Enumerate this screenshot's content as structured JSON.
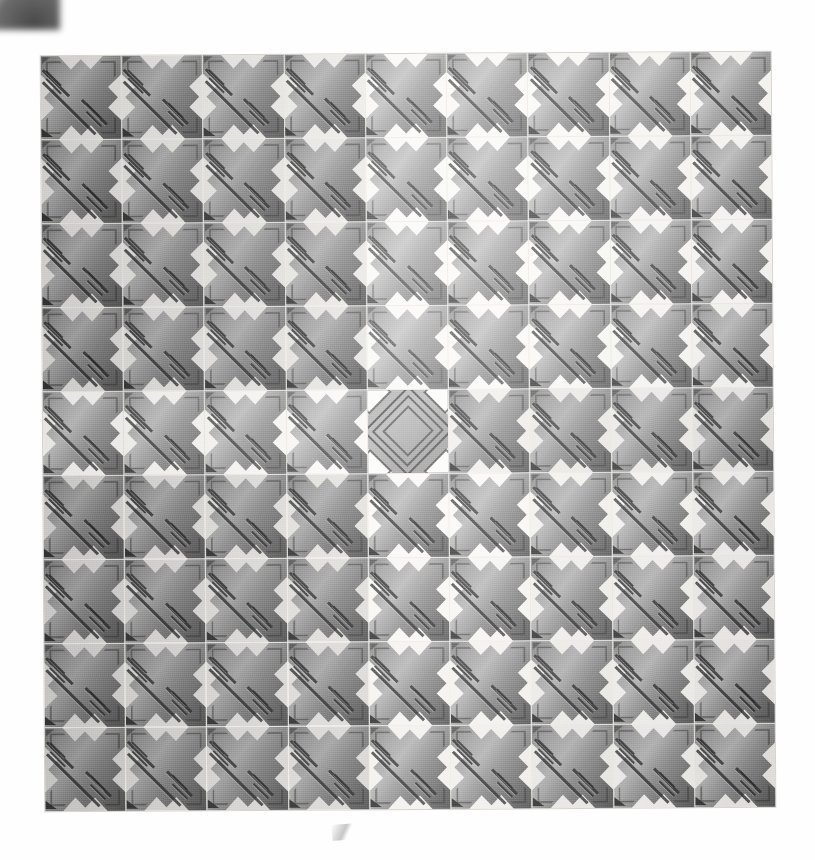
{
  "scene": {
    "title": "Interlocking cross-shaped paver slab",
    "surface_label": "paving-slab",
    "background_color": "#ffffff",
    "slab_base_color": "#efece6"
  },
  "grid": {
    "columns": 9,
    "rows": 9,
    "left": 43,
    "top": 54,
    "width": 730,
    "height": 755,
    "rotation_deg": -0.35,
    "joint_color": "#efece6"
  },
  "tile_types": {
    "cross": {
      "name": "cross-paver",
      "fill_light": "#bdbdbd",
      "fill_mid": "#a9a9a9",
      "fill_dark": "#777777",
      "groove_color": "#303030",
      "notch_color": "#2f2f2f"
    },
    "diamond": {
      "name": "diamond-paver",
      "fill_light": "#b8b8b8",
      "fill_dark": "#929292",
      "outline_color": "#343434",
      "void_color": "#fdfdfb"
    }
  },
  "tiles": [
    [
      {
        "type": "cross",
        "tone": 0.93
      },
      {
        "type": "cross",
        "tone": 0.94
      },
      {
        "type": "cross",
        "tone": 0.95
      },
      {
        "type": "cross",
        "tone": 0.96
      },
      {
        "type": "cross",
        "tone": 1.08
      },
      {
        "type": "cross",
        "tone": 1.06
      },
      {
        "type": "cross",
        "tone": 1.03
      },
      {
        "type": "cross",
        "tone": 1.04
      },
      {
        "type": "cross",
        "tone": 1.02
      }
    ],
    [
      {
        "type": "cross",
        "tone": 0.92
      },
      {
        "type": "cross",
        "tone": 0.93
      },
      {
        "type": "cross",
        "tone": 0.94
      },
      {
        "type": "cross",
        "tone": 0.95
      },
      {
        "type": "cross",
        "tone": 1.09
      },
      {
        "type": "cross",
        "tone": 1.05
      },
      {
        "type": "cross",
        "tone": 1.02
      },
      {
        "type": "cross",
        "tone": 1.03
      },
      {
        "type": "cross",
        "tone": 1.01
      }
    ],
    [
      {
        "type": "cross",
        "tone": 0.91
      },
      {
        "type": "cross",
        "tone": 0.92
      },
      {
        "type": "cross",
        "tone": 0.93
      },
      {
        "type": "cross",
        "tone": 0.94
      },
      {
        "type": "cross",
        "tone": 1.1
      },
      {
        "type": "cross",
        "tone": 1.04
      },
      {
        "type": "cross",
        "tone": 1.01
      },
      {
        "type": "cross",
        "tone": 1.02
      },
      {
        "type": "cross",
        "tone": 1.0
      }
    ],
    [
      {
        "type": "cross",
        "tone": 0.9
      },
      {
        "type": "cross",
        "tone": 0.91
      },
      {
        "type": "cross",
        "tone": 0.92
      },
      {
        "type": "cross",
        "tone": 0.93
      },
      {
        "type": "cross",
        "tone": 1.11
      },
      {
        "type": "cross",
        "tone": 1.03
      },
      {
        "type": "cross",
        "tone": 1.0
      },
      {
        "type": "cross",
        "tone": 1.01
      },
      {
        "type": "cross",
        "tone": 0.99
      }
    ],
    [
      {
        "type": "cross",
        "tone": 1.04
      },
      {
        "type": "cross",
        "tone": 1.05
      },
      {
        "type": "cross",
        "tone": 1.06
      },
      {
        "type": "cross",
        "tone": 1.07
      },
      {
        "type": "diamond",
        "tone": 1.05
      },
      {
        "type": "cross",
        "tone": 0.96
      },
      {
        "type": "cross",
        "tone": 0.95
      },
      {
        "type": "cross",
        "tone": 0.96
      },
      {
        "type": "cross",
        "tone": 0.94
      }
    ],
    [
      {
        "type": "cross",
        "tone": 0.88
      },
      {
        "type": "cross",
        "tone": 0.89
      },
      {
        "type": "cross",
        "tone": 0.9
      },
      {
        "type": "cross",
        "tone": 0.91
      },
      {
        "type": "cross",
        "tone": 1.0
      },
      {
        "type": "cross",
        "tone": 1.0
      },
      {
        "type": "cross",
        "tone": 0.98
      },
      {
        "type": "cross",
        "tone": 0.99
      },
      {
        "type": "cross",
        "tone": 0.97
      }
    ],
    [
      {
        "type": "cross",
        "tone": 0.87
      },
      {
        "type": "cross",
        "tone": 0.88
      },
      {
        "type": "cross",
        "tone": 0.89
      },
      {
        "type": "cross",
        "tone": 0.9
      },
      {
        "type": "cross",
        "tone": 0.99
      },
      {
        "type": "cross",
        "tone": 0.99
      },
      {
        "type": "cross",
        "tone": 0.97
      },
      {
        "type": "cross",
        "tone": 0.98
      },
      {
        "type": "cross",
        "tone": 0.96
      }
    ],
    [
      {
        "type": "cross",
        "tone": 0.86
      },
      {
        "type": "cross",
        "tone": 0.87
      },
      {
        "type": "cross",
        "tone": 0.88
      },
      {
        "type": "cross",
        "tone": 0.89
      },
      {
        "type": "cross",
        "tone": 0.98
      },
      {
        "type": "cross",
        "tone": 0.98
      },
      {
        "type": "cross",
        "tone": 0.96
      },
      {
        "type": "cross",
        "tone": 0.97
      },
      {
        "type": "cross",
        "tone": 0.95
      }
    ],
    [
      {
        "type": "cross",
        "tone": 0.85
      },
      {
        "type": "cross",
        "tone": 0.86
      },
      {
        "type": "cross",
        "tone": 0.87
      },
      {
        "type": "cross",
        "tone": 0.88
      },
      {
        "type": "cross",
        "tone": 0.97
      },
      {
        "type": "cross",
        "tone": 0.97
      },
      {
        "type": "cross",
        "tone": 0.95
      },
      {
        "type": "cross",
        "tone": 0.96
      },
      {
        "type": "cross",
        "tone": 0.94
      }
    ]
  ],
  "artifacts": {
    "corner_smudge_label": "scan-corner-smudge",
    "bottom_smudge_label": "scan-bottom-smudge"
  }
}
